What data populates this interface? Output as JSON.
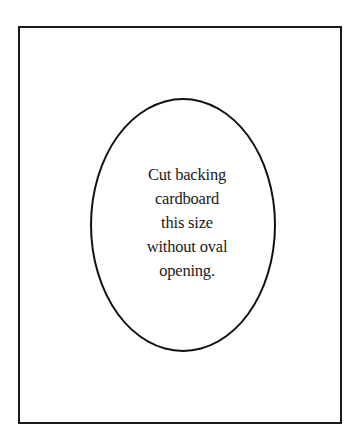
{
  "diagram": {
    "type": "template",
    "outer_rectangle": {
      "description": "backing cardboard outline",
      "stroke_color": "#1a1a1a"
    },
    "oval": {
      "description": "oval opening outline",
      "stroke_color": "#111111"
    },
    "instruction": {
      "lines": [
        "Cut backing",
        "cardboard",
        "this size",
        "without oval",
        "opening."
      ]
    }
  }
}
